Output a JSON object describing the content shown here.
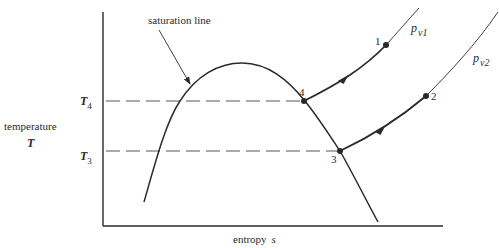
{
  "diagram": {
    "type": "temperature-entropy diagram",
    "y_axis": {
      "label": "temperature",
      "symbol": "T"
    },
    "x_axis": {
      "label": "entropy",
      "symbol": "s"
    },
    "annotations": {
      "saturation_line": "saturation line"
    },
    "temperature_levels": [
      {
        "name": "T",
        "subscript": "4"
      },
      {
        "name": "T",
        "subscript": "3"
      }
    ],
    "isobars": [
      {
        "name": "p",
        "subscript": "v1"
      },
      {
        "name": "p",
        "subscript": "v2"
      }
    ],
    "points": [
      {
        "id": "1"
      },
      {
        "id": "2"
      },
      {
        "id": "3"
      },
      {
        "id": "4"
      }
    ],
    "colors": {
      "ink": "#2a2a2a",
      "dashed": "#555555",
      "background": "#ffffff"
    }
  }
}
